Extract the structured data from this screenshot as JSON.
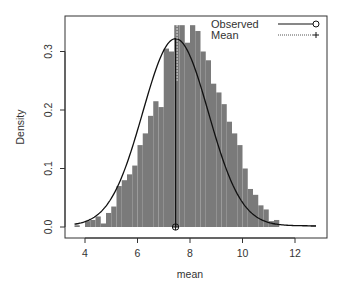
{
  "chart_data": {
    "type": "bar",
    "subtype": "histogram_with_density",
    "title": "",
    "xlabel": "mean",
    "ylabel": "Density",
    "xlim": [
      3.4,
      13.3
    ],
    "ylim": [
      0.0,
      0.36
    ],
    "x_ticks": [
      4,
      6,
      8,
      10,
      12
    ],
    "x_tick_labels": [
      "4",
      "6",
      "8",
      "10",
      "12"
    ],
    "y_ticks": [
      0.0,
      0.1,
      0.2,
      0.3
    ],
    "y_tick_labels": [
      "0.0",
      "0.1",
      "0.2",
      "0.3"
    ],
    "grid": false,
    "bin_width": 0.2,
    "bins_start": [
      3.6,
      3.8,
      4.0,
      4.2,
      4.4,
      4.6,
      4.8,
      5.0,
      5.2,
      5.4,
      5.6,
      5.8,
      6.0,
      6.2,
      6.4,
      6.6,
      6.8,
      7.0,
      7.2,
      7.4,
      7.6,
      7.8,
      8.0,
      8.2,
      8.4,
      8.6,
      8.8,
      9.0,
      9.2,
      9.4,
      9.6,
      9.8,
      10.0,
      10.2,
      10.4,
      10.6,
      10.8,
      11.0,
      11.2,
      11.4,
      11.6,
      11.8,
      12.0,
      12.2,
      12.4,
      12.6
    ],
    "values": [
      0.003,
      0.0,
      0.01,
      0.012,
      0.018,
      0.006,
      0.024,
      0.035,
      0.07,
      0.08,
      0.09,
      0.105,
      0.14,
      0.16,
      0.19,
      0.215,
      0.205,
      0.305,
      0.3,
      0.345,
      0.345,
      0.315,
      0.345,
      0.335,
      0.3,
      0.285,
      0.245,
      0.23,
      0.21,
      0.18,
      0.16,
      0.14,
      0.1,
      0.065,
      0.055,
      0.037,
      0.03,
      0.01,
      0.012,
      0.0,
      0.0,
      0.0,
      0.0,
      0.0,
      0.0,
      0.003
    ],
    "series": [
      {
        "name": "Observed",
        "style": "solid line, circle marker",
        "value": 7.45
      },
      {
        "name": "Mean",
        "style": "dotted line, plus marker",
        "value": 7.45
      }
    ],
    "density_curve": {
      "distribution": "normal",
      "mean": 7.45,
      "sd": 1.25,
      "peak": 0.32
    },
    "legend": {
      "position": "top-right",
      "entries": [
        "Observed",
        "Mean"
      ]
    },
    "colors": {
      "bars": "#7a7a7a",
      "curve": "#111111",
      "axes": "#333333"
    }
  },
  "legend": {
    "observed_label": "Observed",
    "mean_label": "Mean"
  },
  "axes": {
    "xlabel": "mean",
    "ylabel": "Density"
  }
}
